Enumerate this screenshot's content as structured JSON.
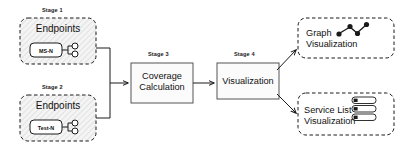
{
  "diagram": {
    "colors": {
      "stroke": "#1a1a1a",
      "text": "#111111",
      "hatch_fill": "#f2f2f2",
      "hatch_line": "#c9c9c9",
      "process_fill": "#fbfbfb",
      "canvas": "#ffffff"
    },
    "stages": [
      {
        "id": "stage-1",
        "label": "Stage 1",
        "group_title": "Endpoints",
        "node_label": "MS-N",
        "style": "dashed-hatched",
        "endpoint_ports": 2
      },
      {
        "id": "stage-2",
        "label": "Stage 2",
        "group_title": "Endpoints",
        "node_label": "Test-N",
        "style": "dashed-hatched",
        "endpoint_ports": 2
      },
      {
        "id": "stage-3",
        "label": "Stage 3",
        "box_line1": "Coverage",
        "box_line2": "Calculation",
        "style": "solid"
      },
      {
        "id": "stage-4",
        "label": "Stage 4",
        "box_line1": "Visualization",
        "style": "solid"
      }
    ],
    "outputs": [
      {
        "id": "graph-visualization",
        "line1": "Graph",
        "line2": "Visualization",
        "icon": "node-link-graph-icon",
        "style": "dashed"
      },
      {
        "id": "service-list-visualization",
        "line1": "Service List",
        "line2": "Visualization",
        "icon": "list-rows-icon",
        "icon_rows": 3,
        "style": "dashed"
      }
    ],
    "connectors": [
      {
        "id": "endpoints-merge-to-coverage",
        "from": [
          "stage-1",
          "stage-2"
        ],
        "to": "stage-3",
        "arrow": true
      },
      {
        "id": "coverage-to-visualization",
        "from": [
          "stage-3"
        ],
        "to": "stage-4",
        "arrow": true
      },
      {
        "id": "visualization-to-graph",
        "from": [
          "stage-4"
        ],
        "to": "graph-visualization",
        "arrow": true
      },
      {
        "id": "visualization-to-service-list",
        "from": [
          "stage-4"
        ],
        "to": "service-list-visualization",
        "arrow": true
      }
    ]
  }
}
